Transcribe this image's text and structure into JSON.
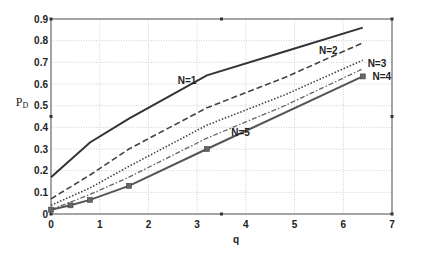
{
  "chart_data": {
    "type": "line",
    "title": "",
    "xlabel": "q",
    "ylabel": "P_D",
    "xlim": [
      0,
      7
    ],
    "ylim": [
      0,
      0.9
    ],
    "xticks": [
      0,
      1,
      2,
      3,
      4,
      5,
      6,
      7
    ],
    "yticks": [
      0,
      0.1,
      0.2,
      0.3,
      0.4,
      0.5,
      0.6,
      0.7,
      0.8,
      0.9
    ],
    "ytick_labels": [
      "0",
      "0.1",
      "0.2",
      "0.3",
      "0.4",
      "0.5",
      "0.6",
      "0.7",
      "0.8",
      "0.9"
    ],
    "grid": true,
    "legend": "inline labels",
    "series": [
      {
        "name": "N=1",
        "style": "solid",
        "color": "#333333",
        "x": [
          0,
          0.8,
          1.6,
          3.2,
          4.8,
          6.4
        ],
        "y": [
          0.17,
          0.33,
          0.44,
          0.64,
          0.75,
          0.86
        ],
        "label_pos": [
          2.6,
          0.6
        ]
      },
      {
        "name": "N=2",
        "style": "dashed",
        "color": "#444444",
        "x": [
          0,
          0.8,
          1.6,
          3.2,
          4.8,
          6.4
        ],
        "y": [
          0.07,
          0.18,
          0.3,
          0.49,
          0.63,
          0.79
        ],
        "label_pos": [
          5.5,
          0.74
        ]
      },
      {
        "name": "N=3",
        "style": "dotted",
        "color": "#444444",
        "x": [
          0,
          0.8,
          1.6,
          3.2,
          4.8,
          6.4
        ],
        "y": [
          0.04,
          0.12,
          0.22,
          0.41,
          0.55,
          0.71
        ],
        "label_pos": [
          6.5,
          0.68
        ]
      },
      {
        "name": "N=4",
        "style": "dashdot",
        "color": "#666666",
        "x": [
          0,
          0.8,
          1.6,
          3.2,
          4.8,
          6.4
        ],
        "y": [
          0.02,
          0.09,
          0.17,
          0.35,
          0.5,
          0.67
        ],
        "label_pos": [
          6.6,
          0.62
        ]
      },
      {
        "name": "N=5",
        "style": "solid-square",
        "color": "#555555",
        "x": [
          0,
          0.4,
          0.8,
          1.6,
          3.2,
          6.4
        ],
        "y": [
          0.02,
          0.04,
          0.065,
          0.13,
          0.3,
          0.635
        ],
        "label_pos": [
          3.7,
          0.36
        ]
      }
    ]
  }
}
